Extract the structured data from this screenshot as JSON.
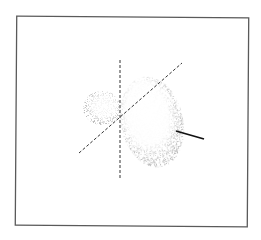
{
  "figure": {
    "frame": {
      "x1": 16,
      "y1": 17,
      "x2": 248,
      "y2": 226,
      "color": "#5a5a5a"
    },
    "axes": {
      "vertical_dashed": {
        "x1": 120,
        "y1": 60,
        "x2": 120,
        "y2": 178,
        "color": "#333333"
      },
      "diagonal_dashed": {
        "x1": 79,
        "y1": 153,
        "x2": 182,
        "y2": 63,
        "color": "#333333"
      },
      "solid_axis": {
        "x1": 176,
        "y1": 131,
        "x2": 204,
        "y2": 139,
        "color": "#111111"
      }
    },
    "lobes": [
      {
        "name": "large-lobe",
        "cx": 152,
        "cy": 122,
        "rx": 31,
        "ry": 46,
        "rotate": -12
      },
      {
        "name": "small-lobe",
        "cx": 102,
        "cy": 108,
        "rx": 19,
        "ry": 17,
        "rotate": 0
      }
    ],
    "stipple_color": "#8a8a8a"
  }
}
